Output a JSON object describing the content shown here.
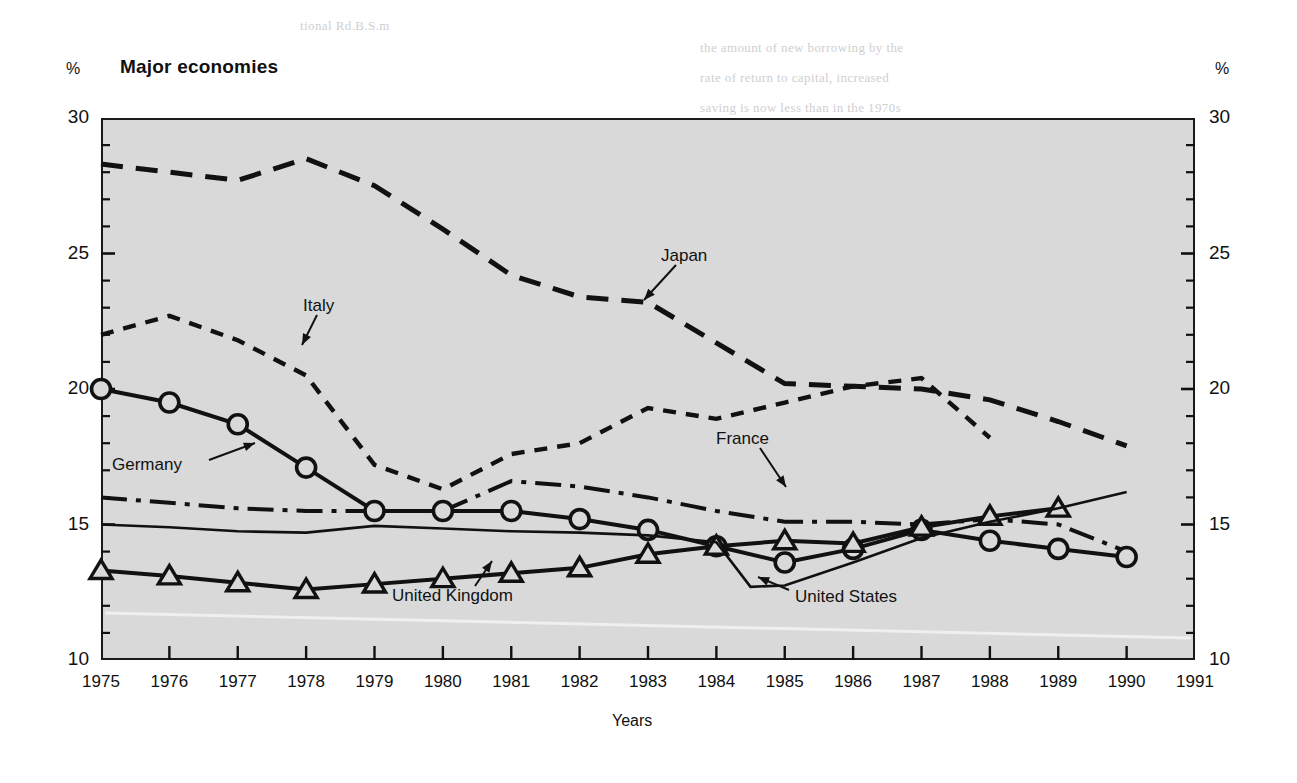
{
  "figure": {
    "title": "Major economies",
    "unit_label_left": "%",
    "unit_label_right": "%",
    "x_caption": "Years"
  },
  "bleed_text": [
    {
      "text": "tional Rd.B.S.m",
      "x": 300,
      "y": 18
    },
    {
      "text": "the amount of new borrowing by the",
      "x": 700,
      "y": 40
    },
    {
      "text": "rate of return to capital, increased",
      "x": 700,
      "y": 70
    },
    {
      "text": "saving is now less than in the 1970s",
      "x": 700,
      "y": 100
    },
    {
      "text": "expansion, the surplus of the public",
      "x": 700,
      "y": 130
    },
    {
      "text": "much of the 1980s and more recent",
      "x": 700,
      "y": 160
    },
    {
      "text": "tion. Since the late 1980s there has",
      "x": 700,
      "y": 190
    },
    {
      "text": "in the level of world interest rates.",
      "x": 700,
      "y": 220
    },
    {
      "text": "growth rates and a lower capital",
      "x": 700,
      "y": 250
    },
    {
      "text": "economies of the OECD area in the",
      "x": 700,
      "y": 280
    },
    {
      "text": "recovery from the 1981-82 recession",
      "x": 700,
      "y": 310
    },
    {
      "text": "balance of the private sector and a",
      "x": 700,
      "y": 340
    },
    {
      "text": "world saving shortfall relative to the",
      "x": 700,
      "y": 372
    },
    {
      "text": "important reduction in the overall",
      "x": 700,
      "y": 404
    },
    {
      "text": "investment demand in recent years",
      "x": 700,
      "y": 436
    }
  ],
  "chart_data": {
    "type": "line",
    "title": "Major economies",
    "xlabel": "Years",
    "ylabel": "%",
    "xlim": [
      1975,
      1991
    ],
    "ylim": [
      10,
      30
    ],
    "y_major_ticks": [
      10,
      15,
      20,
      25,
      30
    ],
    "y_minor_tick_step": 1,
    "x_ticks": [
      1975,
      1976,
      1977,
      1978,
      1979,
      1980,
      1981,
      1982,
      1983,
      1984,
      1985,
      1986,
      1987,
      1988,
      1989,
      1990,
      1991
    ],
    "x_tick_labels": [
      "1975",
      "1976",
      "1977",
      "1978",
      "1979",
      "1980",
      "1981",
      "1982",
      "1983",
      "1984",
      "1985",
      "1986",
      "1987",
      "1988",
      "1989",
      "1990",
      "1991"
    ],
    "grid": false,
    "legend": "inline-annotations",
    "plot_background": "#d9d9d9",
    "line_color": "#111111",
    "series": [
      {
        "name": "Japan",
        "style": "long-dashed",
        "marker": "none",
        "x": [
          1975,
          1976,
          1977,
          1978,
          1979,
          1980,
          1981,
          1982,
          1983,
          1984,
          1985,
          1986,
          1987,
          1988,
          1989,
          1990
        ],
        "values": [
          28.3,
          28.0,
          27.7,
          28.5,
          27.5,
          25.9,
          24.2,
          23.4,
          23.2,
          21.7,
          20.2,
          20.1,
          20.0,
          19.6,
          18.8,
          17.9
        ]
      },
      {
        "name": "Italy",
        "style": "short-dashed",
        "marker": "none",
        "x": [
          1975,
          1976,
          1977,
          1978,
          1979,
          1980,
          1981,
          1982,
          1983,
          1984,
          1985,
          1986,
          1987,
          1988
        ],
        "values": [
          22.0,
          22.7,
          21.8,
          20.5,
          17.2,
          16.3,
          17.6,
          18.0,
          19.3,
          18.9,
          19.5,
          20.1,
          20.4,
          18.2
        ]
      },
      {
        "name": "France",
        "style": "dash-dot",
        "marker": "none",
        "x": [
          1975,
          1976,
          1977,
          1978,
          1979,
          1980,
          1981,
          1982,
          1983,
          1984,
          1985,
          1986,
          1987,
          1988,
          1989,
          1990
        ],
        "values": [
          16.0,
          15.8,
          15.6,
          15.5,
          15.5,
          15.5,
          16.6,
          16.4,
          16.0,
          15.5,
          15.1,
          15.1,
          15.0,
          15.2,
          15.0,
          14.0
        ]
      },
      {
        "name": "Germany",
        "style": "solid",
        "marker": "circle",
        "x": [
          1975,
          1976,
          1977,
          1978,
          1979,
          1980,
          1981,
          1982,
          1983,
          1984,
          1985,
          1986,
          1987,
          1988,
          1989,
          1990
        ],
        "values": [
          20.0,
          19.5,
          18.7,
          17.1,
          15.5,
          15.5,
          15.5,
          15.2,
          14.8,
          14.2,
          13.6,
          14.1,
          14.8,
          14.4,
          14.1,
          13.8
        ]
      },
      {
        "name": "United Kingdom",
        "style": "solid",
        "marker": "triangle",
        "x": [
          1975,
          1976,
          1977,
          1978,
          1979,
          1980,
          1981,
          1982,
          1983,
          1984,
          1985,
          1986,
          1987,
          1988,
          1989
        ],
        "values": [
          13.3,
          13.1,
          12.85,
          12.6,
          12.8,
          13.0,
          13.2,
          13.4,
          13.9,
          14.2,
          14.4,
          14.3,
          14.9,
          15.3,
          15.6
        ]
      },
      {
        "name": "United States",
        "style": "solid-thin",
        "marker": "none",
        "x": [
          1975,
          1976,
          1977,
          1978,
          1979,
          1980,
          1981,
          1982,
          1983,
          1984,
          1984.5,
          1985,
          1986,
          1987,
          1988,
          1989,
          1990
        ],
        "values": [
          15.0,
          14.9,
          14.75,
          14.7,
          14.95,
          14.85,
          14.75,
          14.7,
          14.6,
          14.35,
          12.7,
          12.75,
          13.6,
          14.5,
          15.1,
          15.6,
          16.2
        ]
      }
    ]
  },
  "annotations": [
    {
      "label": "Japan",
      "x": 661,
      "y": 246,
      "arrow": {
        "x1": 676,
        "y1": 265,
        "x2": 644,
        "y2": 300
      }
    },
    {
      "label": "Italy",
      "x": 303,
      "y": 296,
      "arrow": {
        "x1": 317,
        "y1": 315,
        "x2": 302,
        "y2": 345
      }
    },
    {
      "label": "France",
      "x": 716,
      "y": 429,
      "arrow": {
        "x1": 760,
        "y1": 448,
        "x2": 786,
        "y2": 487
      }
    },
    {
      "label": "Germany",
      "x": 112,
      "y": 455,
      "arrow": {
        "x1": 209,
        "y1": 460,
        "x2": 255,
        "y2": 443
      }
    },
    {
      "label": "United Kingdom",
      "x": 392,
      "y": 586,
      "arrow": {
        "x1": 475,
        "y1": 586,
        "x2": 492,
        "y2": 561
      }
    },
    {
      "label": "United States",
      "x": 795,
      "y": 587,
      "arrow": {
        "x1": 789,
        "y1": 590,
        "x2": 758,
        "y2": 577
      }
    }
  ]
}
